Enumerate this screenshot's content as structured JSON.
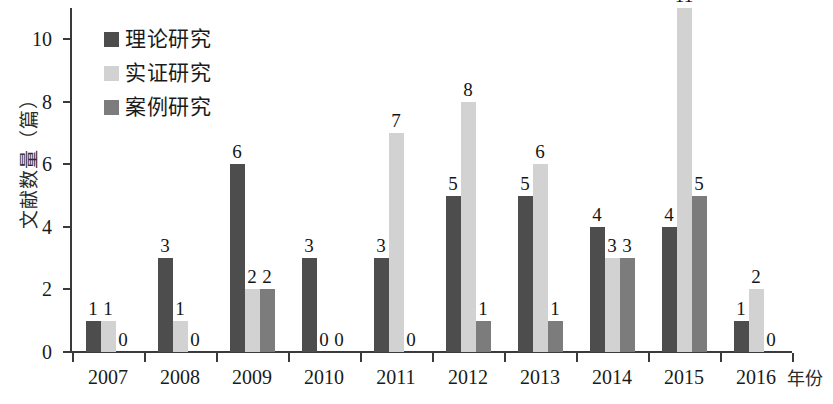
{
  "chart_data": {
    "type": "bar",
    "title": "",
    "subtitle": "",
    "xlabel": "年份",
    "ylabel": "文献数量（篇）",
    "categories": [
      "2007",
      "2008",
      "2009",
      "2010",
      "2011",
      "2012",
      "2013",
      "2014",
      "2015",
      "2016"
    ],
    "series": [
      {
        "name": "理论研究",
        "color": "#4d4d4d",
        "values": [
          1,
          3,
          6,
          3,
          3,
          5,
          5,
          4,
          4,
          1
        ]
      },
      {
        "name": "实证研究",
        "color": "#d2d2d2",
        "values": [
          1,
          1,
          2,
          0,
          7,
          8,
          6,
          3,
          11,
          2
        ]
      },
      {
        "name": "案例研究",
        "color": "#7c7c7c",
        "values": [
          0,
          0,
          2,
          0,
          0,
          1,
          1,
          3,
          5,
          0
        ]
      }
    ],
    "ylim": [
      0,
      11
    ],
    "yticks": [
      0,
      2,
      4,
      6,
      8,
      10
    ],
    "ytick_labels": [
      "0",
      "2",
      "4",
      "6",
      "8",
      "10"
    ],
    "grid": false,
    "legend_position": "top-left"
  },
  "axes": {
    "y_title": "文献数量（篇）",
    "x_title": "年份"
  },
  "legend": {
    "entries": [
      {
        "label": "理论研究",
        "swatch": "#4d4d4d"
      },
      {
        "label": "实证研究",
        "swatch": "#d2d2d2"
      },
      {
        "label": "案例研究",
        "swatch": "#7c7c7c"
      }
    ]
  }
}
